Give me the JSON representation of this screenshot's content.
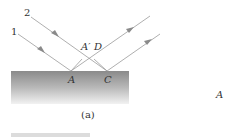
{
  "figure": {
    "caption": "(a)",
    "ray_labels": {
      "ray1": "1",
      "ray2": "2"
    },
    "point_labels": {
      "A": "A",
      "A_prime": "A′",
      "D": "D",
      "C": "C"
    },
    "side_label": "A",
    "colors": {
      "ray": "#9a9a9a",
      "surface_top": "#8a8a8a",
      "surface_bottom": "#f2f2f2",
      "text": "#333333"
    }
  }
}
